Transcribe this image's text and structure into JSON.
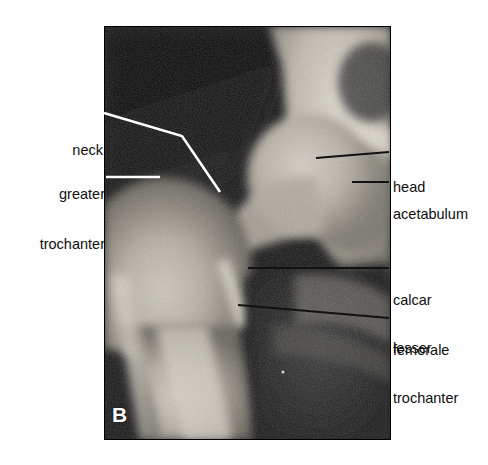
{
  "figure": {
    "panel_letter": "B",
    "modality": "radiograph",
    "view": "anteroposterior",
    "background_color": "#fdfdfd",
    "plate": {
      "left": 104,
      "top": 26,
      "width": 287,
      "height": 414,
      "border_color": "#000000"
    }
  },
  "annotations": {
    "left_labels": [
      {
        "id": "neck",
        "text": "neck",
        "lines": [
          "neck"
        ],
        "align": "right",
        "leader": {
          "type": "polyline",
          "points": "104,113 182,136 220,192",
          "color": "#ffffff",
          "width": 2.6
        }
      },
      {
        "id": "greater-trochanter",
        "text": "greater trochanter",
        "lines": [
          "greater",
          "trochanter"
        ],
        "align": "right",
        "leader": {
          "type": "line",
          "points": "106,177 160,177",
          "color": "#ffffff",
          "width": 2.4
        }
      }
    ],
    "right_labels": [
      {
        "id": "head",
        "text": "head",
        "lines": [
          "head"
        ],
        "align": "left",
        "leader": {
          "type": "line",
          "points": "316,158 389,152",
          "color": "#111111",
          "width": 2.2
        }
      },
      {
        "id": "acetabulum",
        "text": "acetabulum",
        "lines": [
          "acetabulum"
        ],
        "align": "left",
        "leader": {
          "type": "line",
          "points": "352,182 389,182",
          "color": "#111111",
          "width": 2.2
        }
      },
      {
        "id": "calcar-femorale",
        "text": "calcar femorale",
        "lines": [
          "calcar",
          "femorale"
        ],
        "align": "left",
        "leader": {
          "type": "line",
          "points": "248,268 389,268",
          "color": "#111111",
          "width": 2.2
        }
      },
      {
        "id": "lesser-trochanter",
        "text": "lesser trochanter",
        "lines": [
          "lesser",
          "trochanter"
        ],
        "align": "left",
        "leader": {
          "type": "line",
          "points": "238,305 389,318",
          "color": "#111111",
          "width": 2.2
        }
      }
    ]
  },
  "labels_text": {
    "neck": "neck",
    "greater_line1": "greater",
    "greater_line2": "trochanter",
    "head": "head",
    "acetabulum": "acetabulum",
    "calcar_line1": "calcar",
    "calcar_line2": "femorale",
    "lesser_line1": "lesser",
    "lesser_line2": "trochanter"
  },
  "colors": {
    "page": "#fdfdfd",
    "ink": "#101010",
    "leader_light": "#ffffff",
    "leader_dark": "#111111",
    "film_dark": "#0a0a0a",
    "bone_bright": "#e8e4dc",
    "soft_tissue": "#3a3a3a"
  }
}
